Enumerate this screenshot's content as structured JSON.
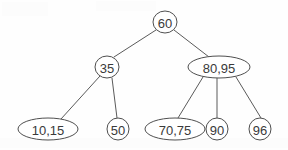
{
  "diagram": {
    "background_color": "#fefefe",
    "stroke_color": "#4f4f4f",
    "text_color": "#3a3a3a",
    "nodes": [
      {
        "id": "n60",
        "label": "60",
        "shape": "circle",
        "cx": 165,
        "cy": 22,
        "rx": 12,
        "ry": 11
      },
      {
        "id": "n35",
        "label": "35",
        "shape": "circle",
        "cx": 107,
        "cy": 67,
        "rx": 12,
        "ry": 11
      },
      {
        "id": "n8095",
        "label": "80,95",
        "shape": "ellipse",
        "cx": 219,
        "cy": 67,
        "rx": 31,
        "ry": 11
      },
      {
        "id": "n1015",
        "label": "10,15",
        "shape": "ellipse",
        "cx": 48,
        "cy": 129,
        "rx": 30,
        "ry": 11
      },
      {
        "id": "n50",
        "label": "50",
        "shape": "circle",
        "cx": 118,
        "cy": 129,
        "rx": 11,
        "ry": 11
      },
      {
        "id": "n7075",
        "label": "70,75",
        "shape": "ellipse",
        "cx": 175,
        "cy": 129,
        "rx": 30,
        "ry": 11
      },
      {
        "id": "n90",
        "label": "90",
        "shape": "circle",
        "cx": 217,
        "cy": 129,
        "rx": 11,
        "ry": 11
      },
      {
        "id": "n96",
        "label": "96",
        "shape": "circle",
        "cx": 260,
        "cy": 129,
        "rx": 11,
        "ry": 11
      }
    ],
    "edges": [
      {
        "id": "e1",
        "from": "n60",
        "to": "n35",
        "x1": 156,
        "y1": 30,
        "x2": 114,
        "y2": 57
      },
      {
        "id": "e2",
        "from": "n60",
        "to": "n8095",
        "x1": 174,
        "y1": 30,
        "x2": 209,
        "y2": 57
      },
      {
        "id": "e3",
        "from": "n35",
        "to": "n1015",
        "x1": 100,
        "y1": 76,
        "x2": 61,
        "y2": 119
      },
      {
        "id": "e4",
        "from": "n35",
        "to": "n50",
        "x1": 112,
        "y1": 78,
        "x2": 117,
        "y2": 118
      },
      {
        "id": "e5",
        "from": "n8095",
        "to": "n7075",
        "x1": 203,
        "y1": 77,
        "x2": 178,
        "y2": 118
      },
      {
        "id": "e6",
        "from": "n8095",
        "to": "n90",
        "x1": 217,
        "y1": 78,
        "x2": 217,
        "y2": 118
      },
      {
        "id": "e7",
        "from": "n8095",
        "to": "n96",
        "x1": 236,
        "y1": 77,
        "x2": 261,
        "y2": 118
      }
    ]
  }
}
